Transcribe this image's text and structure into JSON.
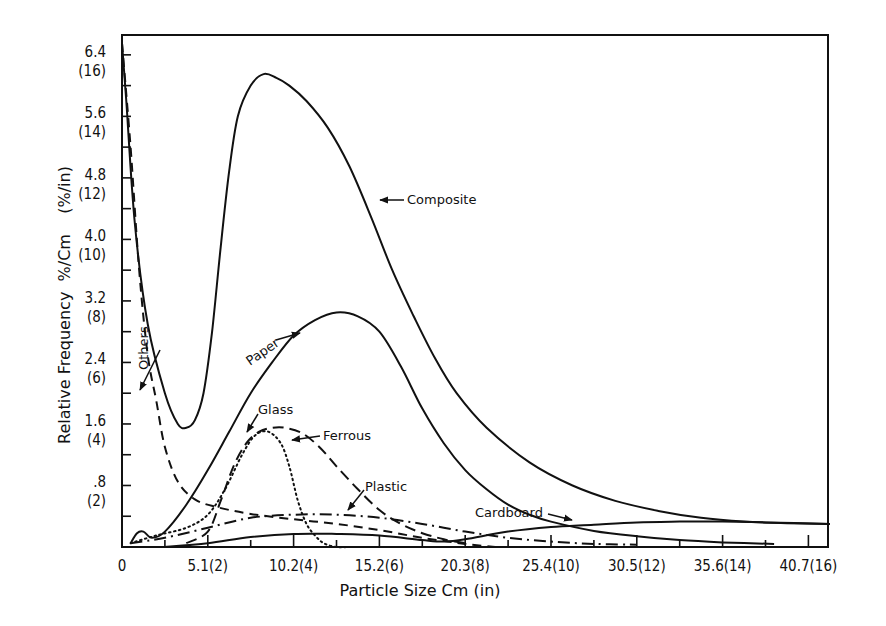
{
  "chart_data": {
    "type": "line",
    "title": "",
    "xlabel": "Particle Size Cm (in)",
    "ylabel": "Relative Frequency  %/Cm    (%/in)",
    "xlim_in": [
      0,
      16.5
    ],
    "ylim": [
      0,
      6.65
    ],
    "grid": false,
    "legend": "inline annotations with arrows",
    "x_ticks": [
      {
        "value_in": 0,
        "label": "0"
      },
      {
        "value_in": 2,
        "label": "5.1(2)"
      },
      {
        "value_in": 4,
        "label": "10.2(4)"
      },
      {
        "value_in": 6,
        "label": "15.2(6)"
      },
      {
        "value_in": 8,
        "label": "20.3(8)"
      },
      {
        "value_in": 10,
        "label": "25.4(10)"
      },
      {
        "value_in": 12,
        "label": "30.5(12)"
      },
      {
        "value_in": 14,
        "label": "35.6(14)"
      },
      {
        "value_in": 16,
        "label": "40.7(16)"
      }
    ],
    "y_ticks": [
      {
        "value": 0.8,
        "label": ".8",
        "alt": "(2)"
      },
      {
        "value": 1.6,
        "label": "1.6",
        "alt": "(4)"
      },
      {
        "value": 2.4,
        "label": "2.4",
        "alt": "(6)"
      },
      {
        "value": 3.2,
        "label": "3.2",
        "alt": "(8)"
      },
      {
        "value": 4.0,
        "label": "4.0",
        "alt": "(10)"
      },
      {
        "value": 4.8,
        "label": "4.8",
        "alt": "(12)"
      },
      {
        "value": 5.6,
        "label": "5.6",
        "alt": "(14)"
      },
      {
        "value": 6.4,
        "label": "6.4",
        "alt": "(16)"
      }
    ],
    "series": [
      {
        "name": "Composite",
        "style": "solid",
        "x": [
          0,
          0.1,
          0.3,
          0.6,
          1.0,
          1.3,
          1.5,
          1.7,
          1.9,
          2.1,
          2.3,
          2.5,
          2.7,
          3.0,
          3.3,
          3.6,
          3.9,
          4.3,
          4.8,
          5.3,
          5.8,
          6.3,
          6.8,
          7.3,
          7.8,
          8.5,
          9.5,
          10.5,
          11.5,
          12.5,
          13.5,
          14.5,
          15.5,
          16.5
        ],
        "y": [
          6.55,
          5.8,
          4.2,
          2.9,
          2.0,
          1.6,
          1.55,
          1.65,
          2.0,
          2.8,
          3.9,
          4.9,
          5.6,
          6.0,
          6.15,
          6.1,
          6.0,
          5.8,
          5.45,
          4.95,
          4.3,
          3.6,
          3.0,
          2.45,
          2.0,
          1.55,
          1.1,
          0.8,
          0.6,
          0.47,
          0.38,
          0.33,
          0.31,
          0.3
        ]
      },
      {
        "name": "Paper",
        "style": "solid",
        "x": [
          0.2,
          0.35,
          0.5,
          0.7,
          1.0,
          1.5,
          2.0,
          2.5,
          3.0,
          3.5,
          4.0,
          4.5,
          5.0,
          5.5,
          6.0,
          6.5,
          7.0,
          7.5,
          8.0,
          8.5,
          9.0,
          9.5,
          10.0,
          11.0,
          12.0,
          13.0,
          14.0,
          15.2
        ],
        "y": [
          0.05,
          0.18,
          0.2,
          0.12,
          0.2,
          0.55,
          1.0,
          1.5,
          2.0,
          2.4,
          2.75,
          2.95,
          3.05,
          3.0,
          2.8,
          2.35,
          1.8,
          1.35,
          1.0,
          0.75,
          0.55,
          0.42,
          0.33,
          0.21,
          0.14,
          0.09,
          0.06,
          0.04
        ]
      },
      {
        "name": "Others",
        "style": "dashed",
        "x": [
          0,
          0.2,
          0.4,
          0.6,
          0.8,
          1.0,
          1.3,
          1.7,
          2.2,
          3.0,
          4.0,
          5.0,
          6.0,
          7.0,
          8.0,
          8.7
        ],
        "y": [
          6.55,
          5.2,
          3.6,
          2.5,
          1.9,
          1.3,
          0.85,
          0.62,
          0.52,
          0.43,
          0.36,
          0.3,
          0.22,
          0.12,
          0.04,
          0.0
        ]
      },
      {
        "name": "Glass",
        "style": "dotted",
        "x": [
          0.2,
          0.8,
          1.5,
          2.0,
          2.4,
          2.8,
          3.1,
          3.4,
          3.7,
          3.9,
          4.1,
          4.3,
          4.5,
          4.7,
          5.0,
          5.3
        ],
        "y": [
          0.05,
          0.15,
          0.25,
          0.42,
          0.75,
          1.2,
          1.45,
          1.5,
          1.35,
          1.05,
          0.6,
          0.3,
          0.15,
          0.05,
          0.0,
          0.0
        ]
      },
      {
        "name": "Ferrous",
        "style": "long-dash",
        "x": [
          1.5,
          2.0,
          2.3,
          2.6,
          2.9,
          3.2,
          3.5,
          3.8,
          4.2,
          4.6,
          5.0,
          5.5,
          6.0,
          6.5,
          7.0,
          7.5,
          8.0
        ],
        "y": [
          0.05,
          0.2,
          0.6,
          1.05,
          1.35,
          1.5,
          1.55,
          1.55,
          1.48,
          1.3,
          1.05,
          0.75,
          0.48,
          0.3,
          0.18,
          0.1,
          0.05
        ]
      },
      {
        "name": "Plastic",
        "style": "dash-dot",
        "x": [
          0.2,
          1.0,
          2.0,
          3.0,
          4.0,
          5.0,
          6.0,
          7.0,
          8.0,
          9.0,
          10.0,
          11.0,
          12.0
        ],
        "y": [
          0.05,
          0.12,
          0.25,
          0.38,
          0.42,
          0.42,
          0.38,
          0.3,
          0.2,
          0.12,
          0.07,
          0.04,
          0.03
        ]
      },
      {
        "name": "Cardboard",
        "style": "solid",
        "x": [
          1.0,
          2.0,
          3.0,
          4.0,
          5.0,
          6.0,
          7.0,
          7.5,
          8.0,
          9.0,
          10.0,
          11.0,
          12.0,
          13.0,
          14.0,
          15.0,
          16.5
        ],
        "y": [
          0.0,
          0.05,
          0.13,
          0.17,
          0.17,
          0.15,
          0.09,
          0.07,
          0.1,
          0.2,
          0.26,
          0.29,
          0.32,
          0.33,
          0.33,
          0.32,
          0.3
        ]
      }
    ],
    "annotations": [
      {
        "text": "Composite",
        "x": 407,
        "y": 204
      },
      {
        "text": "Paper",
        "x": 250,
        "y": 366
      },
      {
        "text": "Others",
        "x": 148,
        "y": 370
      },
      {
        "text": "Glass",
        "x": 258,
        "y": 414
      },
      {
        "text": "Ferrous",
        "x": 323,
        "y": 440
      },
      {
        "text": "Plastic",
        "x": 365,
        "y": 491
      },
      {
        "text": "Cardboard",
        "x": 475,
        "y": 517
      }
    ]
  }
}
